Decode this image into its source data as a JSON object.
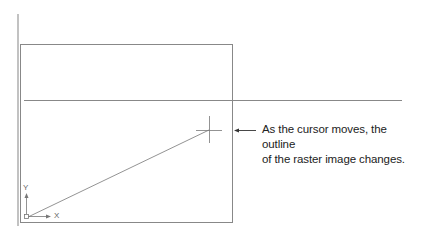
{
  "diagram": {
    "callout_text": {
      "line1": "As the cursor moves, the outline",
      "line2": "of the raster image changes."
    },
    "ucs_icon": {
      "x_label": "X",
      "y_label": "Y"
    },
    "colors": {
      "lines": "#8a8a8a",
      "text": "#222222"
    }
  }
}
